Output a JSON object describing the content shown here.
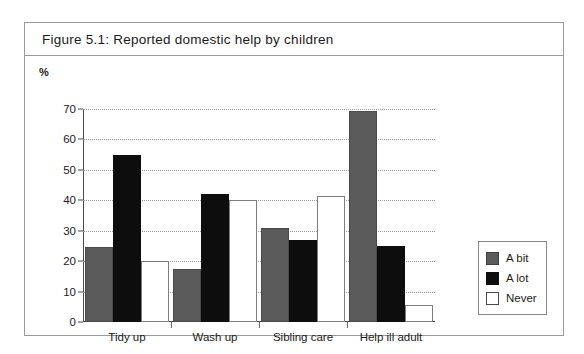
{
  "figure": {
    "title": "Figure 5.1:  Reported domestic help by children"
  },
  "chart_data": {
    "type": "bar",
    "title": "Figure 5.1:  Reported domestic help by children",
    "xlabel": "",
    "ylabel": "%",
    "ylim": [
      0,
      70
    ],
    "yticks": [
      0,
      10,
      20,
      30,
      40,
      50,
      60,
      70
    ],
    "ytick_labels": [
      "0",
      "10",
      "20",
      "30",
      "40",
      "50",
      "60",
      "70"
    ],
    "grid": true,
    "legend_position": "right",
    "categories": [
      "Tidy up",
      "Wash up",
      "Sibling care",
      "Help ill adult"
    ],
    "series": [
      {
        "name": "A bit",
        "color": "#5a5a5a",
        "values": [
          24.5,
          17.5,
          31,
          69.5
        ]
      },
      {
        "name": "A lot",
        "color": "#0d0d0d",
        "values": [
          55,
          42,
          27,
          25
        ]
      },
      {
        "name": "Never",
        "color": "#ffffff",
        "values": [
          20,
          40,
          41.5,
          5.5
        ]
      }
    ]
  },
  "colors": {
    "frame_border": "#9a9a9a",
    "axis": "#4a4a4a",
    "gridline": "#9b9b9b"
  }
}
